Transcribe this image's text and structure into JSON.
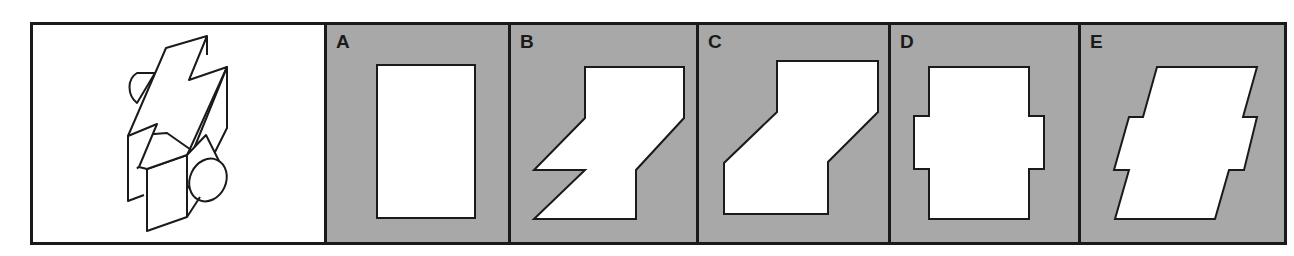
{
  "question": {
    "description": "3D isometric figure: lightning-bolt shaped prism with half-cylinder cap on left and cone on right"
  },
  "options": [
    {
      "label": "A",
      "shape": "rectangle",
      "points": "50,40 148,40 148,193 50,193"
    },
    {
      "label": "B",
      "shape": "lightning-step",
      "points": "74,42 173,42 173,93 125,145 125,194 23,194 74,145 23,145 74,93"
    },
    {
      "label": "C",
      "shape": "step-parallelogram",
      "points": "78,36 179,36 179,87 129,137 129,189 25,189 25,138 78,87"
    },
    {
      "label": "D",
      "shape": "cross-rectangle",
      "points": "38,42 138,42 138,91 153,91 153,144 138,144 138,194 38,194 38,144 23,144 23,91 38,91"
    },
    {
      "label": "E",
      "shape": "notched-parallelogram",
      "points": "76,42 176,42 162,92 176,92 163,145 148,145 134,194 34,194 48,145 33,145 48,92 62,92"
    }
  ],
  "colors": {
    "option_bg": "#a8a8a8",
    "question_bg": "#ffffff",
    "border": "#1a1a1a",
    "shape_fill": "#ffffff"
  }
}
